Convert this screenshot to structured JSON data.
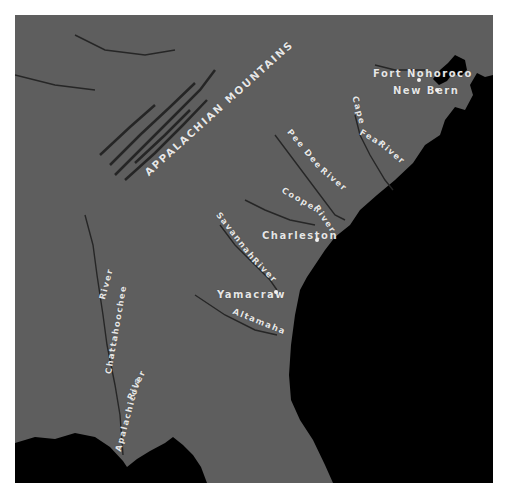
{
  "map": {
    "title_region": "Southeastern United States",
    "colors": {
      "land": "#5e5e5e",
      "water": "#000000",
      "labels": "#e6e6e6",
      "frame_bg": "#ffffff"
    },
    "mountains": [
      {
        "id": "appalachian",
        "label": "APPALACHIAN MOUNTAINS"
      }
    ],
    "places": [
      {
        "id": "fort-nohoroco",
        "label": "Fort Nohoroco"
      },
      {
        "id": "new-bern",
        "label": "New Bern"
      },
      {
        "id": "charleston",
        "label": "Charleston"
      },
      {
        "id": "yamacraw",
        "label": "Yamacraw"
      }
    ],
    "rivers": [
      {
        "id": "cape-fear",
        "label_a": "Cape",
        "label_b": "Fear",
        "label_c": "River"
      },
      {
        "id": "pee-dee",
        "label_a": "Pee Dee",
        "label_b": "River"
      },
      {
        "id": "cooper",
        "label_a": "Cooper",
        "label_b": "River"
      },
      {
        "id": "savannah",
        "label_a": "Savannah",
        "label_b": "River"
      },
      {
        "id": "altamaha",
        "label": "Altamaha"
      },
      {
        "id": "chattahoochee",
        "label_a": "Chattahoochee",
        "label_b": "River"
      },
      {
        "id": "apalachicola",
        "label_a": "Apalachicola",
        "label_b": "River"
      }
    ]
  }
}
